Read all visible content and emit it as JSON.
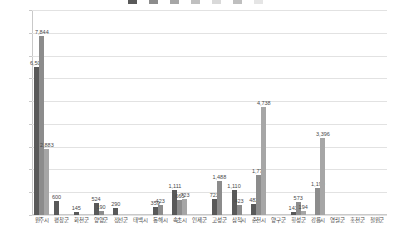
{
  "chart_data": {
    "type": "bar",
    "title": "",
    "xlabel": "",
    "ylabel": "",
    "ylim": [
      0,
      9000
    ],
    "ytick_values": [
      9000,
      8000,
      7000,
      6000,
      5000,
      4000,
      3000,
      2000,
      1000,
      0
    ],
    "ytick_labels": [
      "9,000",
      "8,000",
      "7,000",
      "6,000",
      "5,000",
      "4,000",
      "3,000",
      "2,000",
      "1,000",
      "0"
    ],
    "grid": true,
    "legend_position": "top",
    "categories": [
      "원주시",
      "평창군",
      "화천군",
      "양양군",
      "정선군",
      "태백시",
      "동해시",
      "속초시",
      "인제군",
      "고성군",
      "삼척시",
      "춘천시",
      "양구군",
      "횡성군",
      "강릉시",
      "영월군",
      "홍천군",
      "철원군"
    ],
    "series": [
      {
        "name": "계열1",
        "color": "#595959",
        "values": [
          6502,
          600,
          145,
          524,
          290,
          0,
          359,
          1111,
          0,
          723,
          1110,
          482,
          0,
          143,
          0,
          0,
          0,
          0
        ]
      },
      {
        "name": "계열2",
        "color": "#8c8c8c",
        "values": [
          7844,
          0,
          0,
          190,
          0,
          0,
          423,
          665,
          0,
          1488,
          423,
          1771,
          0,
          573,
          1190,
          0,
          0,
          0
        ]
      },
      {
        "name": "계열3",
        "color": "#a6a6a6",
        "values": [
          2883,
          0,
          0,
          0,
          0,
          0,
          0,
          723,
          0,
          0,
          0,
          4738,
          0,
          194,
          3396,
          0,
          0,
          0
        ]
      }
    ],
    "point_labels": [
      {
        "text": "7,844"
      },
      {
        "text": "6,502"
      },
      {
        "text": "2,883"
      },
      {
        "text": "600"
      },
      {
        "text": "145"
      },
      {
        "text": "524"
      },
      {
        "text": "190"
      },
      {
        "text": "290"
      },
      {
        "text": "359"
      },
      {
        "text": "423"
      },
      {
        "text": "1,111"
      },
      {
        "text": "665"
      },
      {
        "text": "723"
      },
      {
        "text": "1,488"
      },
      {
        "text": "1,110"
      },
      {
        "text": "423"
      },
      {
        "text": "482"
      },
      {
        "text": "1,771"
      },
      {
        "text": "4,738"
      },
      {
        "text": "143"
      },
      {
        "text": "573"
      },
      {
        "text": "194"
      },
      {
        "text": "1,190"
      },
      {
        "text": "3,396"
      }
    ]
  },
  "legend": {
    "items": [
      {
        "label": "",
        "color": "#595959"
      },
      {
        "label": "",
        "color": "#8c8c8c"
      },
      {
        "label": "",
        "color": "#a6a6a6"
      },
      {
        "label": "",
        "color": "#c0c0c0"
      },
      {
        "label": "",
        "color": "#d9d9d9"
      },
      {
        "label": "",
        "color": "#bfbfbf"
      },
      {
        "label": "",
        "color": "#e5e5e5"
      }
    ]
  },
  "axis": {
    "y_max_label": "9,000",
    "y_zero_label": "0"
  }
}
